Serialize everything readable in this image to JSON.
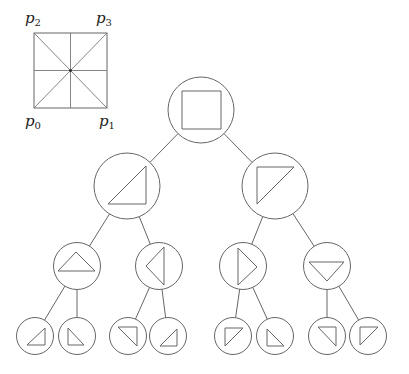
{
  "colors": {
    "stroke": "#666666",
    "background": "#ffffff"
  },
  "legend_square": {
    "x0": 34,
    "y0": 33,
    "x1": 107,
    "y1": 108,
    "labels": [
      {
        "id": "p2",
        "base": "p",
        "sub": "2",
        "x": 25,
        "y": 23
      },
      {
        "id": "p3",
        "base": "p",
        "sub": "3",
        "x": 96,
        "y": 23
      },
      {
        "id": "p0",
        "base": "p",
        "sub": "0",
        "x": 25,
        "y": 126
      },
      {
        "id": "p1",
        "base": "p",
        "sub": "1",
        "x": 99,
        "y": 126
      }
    ]
  },
  "tree": {
    "nodes": [
      {
        "id": "root",
        "cx": 201,
        "cy": 110,
        "r": 33,
        "shape": "square",
        "pts": [
          [
            182,
            91
          ],
          [
            221,
            91
          ],
          [
            221,
            129
          ],
          [
            182,
            129
          ]
        ]
      },
      {
        "id": "L",
        "cx": 127,
        "cy": 186,
        "r": 33,
        "shape": "triangle",
        "pts": [
          [
            108,
            204
          ],
          [
            146,
            166
          ],
          [
            146,
            204
          ]
        ],
        "parent": "root"
      },
      {
        "id": "R",
        "cx": 275,
        "cy": 186,
        "r": 33,
        "shape": "triangle",
        "pts": [
          [
            257,
            167
          ],
          [
            294,
            167
          ],
          [
            257,
            204
          ]
        ],
        "parent": "root"
      },
      {
        "id": "LL",
        "cx": 77,
        "cy": 266,
        "r": 23.5,
        "shape": "triangle",
        "pts": [
          [
            58,
            271
          ],
          [
            95,
            271
          ],
          [
            76,
            252
          ]
        ],
        "parent": "L"
      },
      {
        "id": "LR",
        "cx": 159,
        "cy": 266,
        "r": 23.5,
        "shape": "triangle",
        "pts": [
          [
            146,
            266
          ],
          [
            164,
            247
          ],
          [
            164,
            285
          ]
        ],
        "parent": "L"
      },
      {
        "id": "RL",
        "cx": 243,
        "cy": 266,
        "r": 23.5,
        "shape": "triangle",
        "pts": [
          [
            238,
            248
          ],
          [
            238,
            285
          ],
          [
            257,
            267
          ]
        ],
        "parent": "R"
      },
      {
        "id": "RR",
        "cx": 327,
        "cy": 266,
        "r": 23.5,
        "shape": "triangle",
        "pts": [
          [
            309,
            262
          ],
          [
            344,
            262
          ],
          [
            327,
            281
          ]
        ],
        "parent": "R"
      },
      {
        "id": "LL1",
        "cx": 35,
        "cy": 336,
        "r": 18.5,
        "shape": "triangle",
        "pts": [
          [
            27,
            345
          ],
          [
            45,
            328
          ],
          [
            45,
            345
          ]
        ],
        "parent": "LL"
      },
      {
        "id": "LL2",
        "cx": 77,
        "cy": 336,
        "r": 18.5,
        "shape": "triangle",
        "pts": [
          [
            68,
            328
          ],
          [
            68,
            345
          ],
          [
            84,
            345
          ]
        ],
        "parent": "LL"
      },
      {
        "id": "LR1",
        "cx": 128,
        "cy": 336,
        "r": 18.5,
        "shape": "triangle",
        "pts": [
          [
            118,
            327
          ],
          [
            137,
            327
          ],
          [
            137,
            346
          ]
        ],
        "parent": "LR"
      },
      {
        "id": "LR2",
        "cx": 168,
        "cy": 336,
        "r": 18.5,
        "shape": "triangle",
        "pts": [
          [
            160,
            346
          ],
          [
            177,
            329
          ],
          [
            177,
            346
          ]
        ],
        "parent": "LR"
      },
      {
        "id": "RL1",
        "cx": 233,
        "cy": 336,
        "r": 18.5,
        "shape": "triangle",
        "pts": [
          [
            225,
            328
          ],
          [
            243,
            328
          ],
          [
            225,
            346
          ]
        ],
        "parent": "RL"
      },
      {
        "id": "RL2",
        "cx": 275,
        "cy": 336,
        "r": 18.5,
        "shape": "triangle",
        "pts": [
          [
            267,
            329
          ],
          [
            267,
            346
          ],
          [
            284,
            346
          ]
        ],
        "parent": "RL"
      },
      {
        "id": "RR1",
        "cx": 327,
        "cy": 336,
        "r": 18.5,
        "shape": "triangle",
        "pts": [
          [
            318,
            327
          ],
          [
            336,
            327
          ],
          [
            336,
            346
          ]
        ],
        "parent": "RR"
      },
      {
        "id": "RR2",
        "cx": 368,
        "cy": 336,
        "r": 18.5,
        "shape": "triangle",
        "pts": [
          [
            360,
            327
          ],
          [
            378,
            327
          ],
          [
            360,
            345
          ]
        ],
        "parent": "RR"
      }
    ]
  }
}
